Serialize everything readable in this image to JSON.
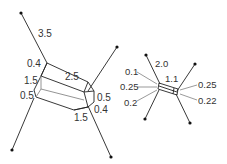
{
  "diagram": {
    "large_crystal": {
      "labels": {
        "axis_length": "3.5",
        "top_cap": "0.4",
        "body_length": "2.5",
        "left_side": "1.5",
        "left_lower": "0.5",
        "right_side": "0.5",
        "right_lower": "0.4",
        "bottom_side": "1.5"
      }
    },
    "small_crystal": {
      "labels": {
        "axis_length": "2.0",
        "body_length": "1.1",
        "left_top": "0.1",
        "left_mid": "0.25",
        "left_bottom": "0.2",
        "right_top": "0.25",
        "right_bottom": "0.22"
      }
    },
    "colors": {
      "line": "#222222",
      "inner_line": "#888888",
      "text": "#333333"
    }
  }
}
